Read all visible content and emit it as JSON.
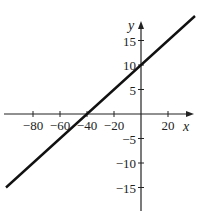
{
  "chart_data": {
    "type": "line",
    "title": "",
    "xlabel": "x",
    "ylabel": "y",
    "xlim": [
      -100,
      40
    ],
    "ylim": [
      -20,
      20
    ],
    "grid": false,
    "x_ticks": [
      -80,
      -60,
      -40,
      -20,
      20
    ],
    "x_tick_labels": [
      "−80",
      "−60",
      "−40",
      "−20",
      "20"
    ],
    "y_ticks": [
      15,
      10,
      5,
      -5,
      -10,
      -15
    ],
    "y_tick_labels": [
      "15",
      "10",
      "5",
      "−5",
      "−10",
      "−15"
    ],
    "series": [
      {
        "name": "y = x/4 + 10",
        "x": [
          -100,
          -40,
          0,
          40
        ],
        "y": [
          -15,
          0,
          10,
          20
        ],
        "color": "#111111"
      }
    ]
  },
  "axes": {
    "x_label": "x",
    "y_label": "y"
  }
}
